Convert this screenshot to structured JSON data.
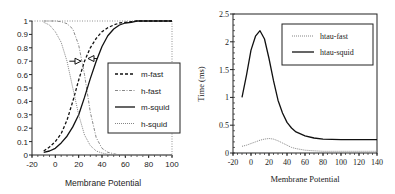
{
  "chart_data": [
    {
      "type": "line",
      "title": "",
      "xlabel": "Membrane Potential",
      "ylabel": "",
      "xlim": [
        -20,
        100
      ],
      "ylim": [
        0,
        1
      ],
      "xticks": [
        -20,
        0,
        20,
        40,
        60,
        80,
        100
      ],
      "yticks": [
        0,
        0.1,
        0.2,
        0.3,
        0.4,
        0.5,
        0.6,
        0.7,
        0.8,
        0.9,
        1
      ],
      "grid": false,
      "legend_position": "right-inside",
      "x": [
        -10,
        -5,
        0,
        5,
        10,
        15,
        20,
        25,
        30,
        35,
        40,
        45,
        50,
        55,
        60,
        65,
        70,
        80,
        90,
        100
      ],
      "series": [
        {
          "name": "m-fast",
          "style": "dashed",
          "values": [
            0.03,
            0.06,
            0.1,
            0.16,
            0.26,
            0.4,
            0.56,
            0.7,
            0.8,
            0.87,
            0.92,
            0.95,
            0.97,
            0.985,
            0.99,
            0.995,
            1.0,
            1.0,
            1.0,
            1.0
          ]
        },
        {
          "name": "h-fast",
          "style": "dash-dot-light",
          "values": [
            1.0,
            1.0,
            1.0,
            0.995,
            0.98,
            0.94,
            0.82,
            0.6,
            0.32,
            0.13,
            0.05,
            0.02,
            0.01,
            0.0,
            0.0,
            0.0,
            0.0,
            0.0,
            0.0,
            0.0
          ]
        },
        {
          "name": "m-squid",
          "style": "solid",
          "values": [
            0.02,
            0.03,
            0.05,
            0.09,
            0.14,
            0.21,
            0.3,
            0.43,
            0.57,
            0.7,
            0.81,
            0.89,
            0.94,
            0.97,
            0.985,
            0.99,
            1.0,
            1.0,
            1.0,
            1.0
          ]
        },
        {
          "name": "h-squid",
          "style": "dotted",
          "values": [
            0.99,
            0.97,
            0.92,
            0.84,
            0.7,
            0.5,
            0.3,
            0.15,
            0.07,
            0.03,
            0.015,
            0.005,
            0.0,
            0.0,
            0.0,
            0.0,
            0.0,
            0.0,
            0.0,
            0.0
          ]
        }
      ],
      "annotations": [
        {
          "type": "arrow",
          "from": [
            12,
            0.7
          ],
          "to": [
            22,
            0.7
          ],
          "direction": "right"
        },
        {
          "type": "arrow",
          "from": [
            36,
            0.72
          ],
          "to": [
            28,
            0.72
          ],
          "direction": "left"
        }
      ]
    },
    {
      "type": "line",
      "title": "",
      "xlabel": "Membrane Potential",
      "ylabel": "Time (ms)",
      "xlim": [
        -20,
        140
      ],
      "ylim": [
        0,
        2.5
      ],
      "xticks": [
        -20,
        0,
        20,
        40,
        60,
        80,
        100,
        120,
        140
      ],
      "yticks": [
        0,
        0.5,
        1,
        1.5,
        2,
        2.5
      ],
      "grid": false,
      "legend_position": "upper-right-inside",
      "x": [
        -10,
        -5,
        0,
        5,
        10,
        15,
        20,
        25,
        30,
        35,
        40,
        45,
        50,
        60,
        70,
        80,
        90,
        100,
        110,
        120,
        130,
        140
      ],
      "series": [
        {
          "name": "htau-fast",
          "style": "dotted",
          "values": [
            0.12,
            0.14,
            0.17,
            0.2,
            0.23,
            0.25,
            0.26,
            0.25,
            0.22,
            0.18,
            0.14,
            0.1,
            0.08,
            0.05,
            0.04,
            0.03,
            0.03,
            0.03,
            0.03,
            0.03,
            0.03,
            0.03
          ]
        },
        {
          "name": "htau-squid",
          "style": "solid",
          "values": [
            1.0,
            1.4,
            1.85,
            2.1,
            2.2,
            2.05,
            1.7,
            1.3,
            0.95,
            0.72,
            0.55,
            0.45,
            0.38,
            0.31,
            0.27,
            0.25,
            0.245,
            0.24,
            0.24,
            0.24,
            0.24,
            0.24
          ]
        }
      ]
    }
  ]
}
